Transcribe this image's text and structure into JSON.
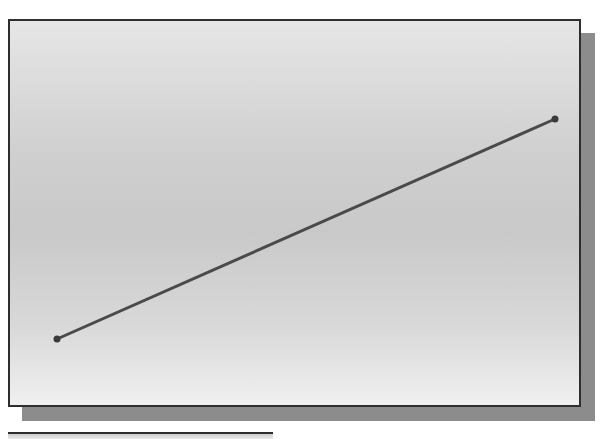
{
  "diagram": {
    "type": "line-segment",
    "line": {
      "start": {
        "x": 57,
        "y": 339
      },
      "end": {
        "x": 555,
        "y": 119
      },
      "stroke_color": "#4a4a4a",
      "stroke_width": 3,
      "endpoint_marker": "dot",
      "endpoint_color": "#3a3a3a"
    },
    "colors": {
      "frame_border": "#2e2e2e",
      "shadow": "#8c8c8c",
      "background_light": "#f0f0f0",
      "background_mid": "#c9c9c9"
    }
  }
}
